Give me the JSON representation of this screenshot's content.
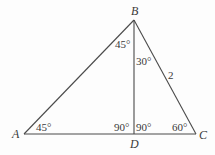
{
  "diagram": {
    "type": "geometry-triangle",
    "vertices": {
      "A": {
        "label": "A",
        "x": 24,
        "y": 134
      },
      "B": {
        "label": "B",
        "x": 134,
        "y": 20
      },
      "C": {
        "label": "C",
        "x": 196,
        "y": 134
      },
      "D": {
        "label": "D",
        "x": 134,
        "y": 134
      }
    },
    "segments": [
      "AB",
      "BC",
      "CA",
      "BD"
    ],
    "angles": {
      "A": "45°",
      "ABD": "45°",
      "DBC": "30°",
      "ADB": "90°",
      "BDC": "90°",
      "C": "60°"
    },
    "side_labels": {
      "BC": "2"
    },
    "colors": {
      "line": "#4a4a4a",
      "text": "#3a3a3a",
      "background": "#fdfdfd"
    }
  }
}
